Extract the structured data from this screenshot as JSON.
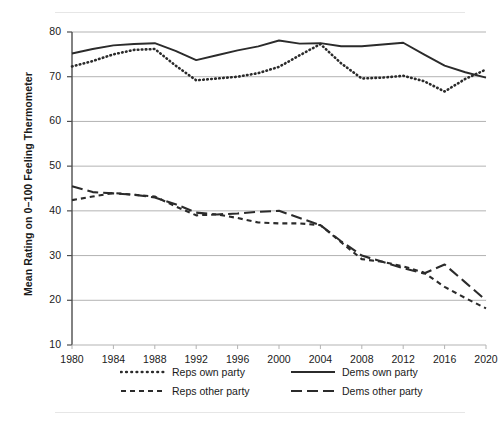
{
  "chart_data": {
    "type": "line",
    "title": "",
    "xlabel": "",
    "ylabel": "Mean Rating on 0–100 Feeling Thermometer",
    "xlim": [
      1980,
      2020
    ],
    "ylim": [
      10,
      80
    ],
    "yticks": [
      10,
      20,
      30,
      40,
      50,
      60,
      70,
      80
    ],
    "xticks": [
      1980,
      1984,
      1988,
      1992,
      1996,
      2000,
      2004,
      2008,
      2012,
      2016,
      2020
    ],
    "grid": "horizontal",
    "legend_position": "bottom",
    "x": [
      1980,
      1982,
      1984,
      1986,
      1988,
      1990,
      1992,
      1994,
      1996,
      1998,
      2000,
      2002,
      2004,
      2006,
      2008,
      2010,
      2012,
      2014,
      2016,
      2018,
      2020
    ],
    "series": [
      {
        "name": "Reps own party",
        "style": "dotted",
        "color": "#2b2b2b",
        "values": [
          72.3,
          73.5,
          75.0,
          76.0,
          76.2,
          72.5,
          69.2,
          69.6,
          70.0,
          70.8,
          72.2,
          74.8,
          77.3,
          73.0,
          69.6,
          69.8,
          70.2,
          69.0,
          66.7,
          69.5,
          71.6
        ]
      },
      {
        "name": "Dems own party",
        "style": "solid",
        "color": "#2b2b2b",
        "values": [
          75.2,
          76.2,
          77.0,
          77.3,
          77.5,
          75.8,
          73.7,
          74.8,
          75.9,
          76.8,
          78.1,
          77.4,
          77.5,
          76.8,
          76.8,
          77.2,
          77.6,
          75.0,
          72.5,
          71.0,
          69.8
        ]
      },
      {
        "name": "Reps other party",
        "style": "dashed-short",
        "color": "#2b2b2b",
        "values": [
          42.4,
          43.2,
          44.0,
          43.6,
          43.2,
          41.0,
          39.0,
          39.2,
          38.4,
          37.4,
          37.2,
          37.2,
          36.8,
          33.0,
          29.2,
          28.6,
          27.6,
          26.2,
          23.0,
          20.5,
          18.2
        ]
      },
      {
        "name": "Dems other party",
        "style": "dashed-long",
        "color": "#2b2b2b",
        "values": [
          45.5,
          44.2,
          43.9,
          43.6,
          43.0,
          41.5,
          39.6,
          39.2,
          39.4,
          39.8,
          40.0,
          38.4,
          36.8,
          33.2,
          30.0,
          28.6,
          27.2,
          26.0,
          28.0,
          24.0,
          20.0
        ]
      }
    ]
  },
  "axis": {
    "ytick_labels": [
      "80",
      "70",
      "60",
      "50",
      "40",
      "30",
      "20",
      "10"
    ],
    "xtick_labels": [
      "1980",
      "1984",
      "1988",
      "1992",
      "1996",
      "2000",
      "2004",
      "2008",
      "2012",
      "2016",
      "2020"
    ],
    "ylabel_text": "Mean Rating on 0–100 Feeling Thermometer"
  },
  "legend": {
    "items": [
      {
        "label": "Reps own party",
        "style": "dotted"
      },
      {
        "label": "Dems own party",
        "style": "solid"
      },
      {
        "label": "Reps other party",
        "style": "dashed-short"
      },
      {
        "label": "Dems other party",
        "style": "dashed-long"
      }
    ]
  },
  "colors": {
    "line": "#2b2b2b",
    "grid": "#b3b3b3",
    "axis": "#4d4d4d",
    "rule": "#e6e6e6",
    "background": "#ffffff"
  }
}
